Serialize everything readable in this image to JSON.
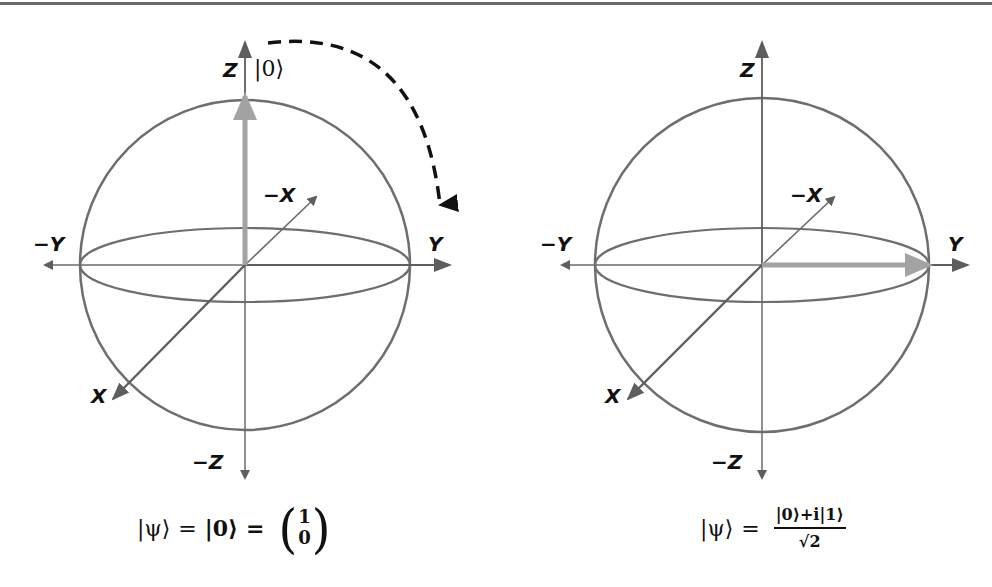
{
  "figure": {
    "colors": {
      "axis": "#6b6b6b",
      "sphere": "#6e6e6e",
      "state_vector": "#a3a3a3",
      "rotation_arrow": "#111111",
      "text": "#111111"
    },
    "left_sphere": {
      "axis_labels": {
        "z": "Z",
        "neg_z": "−Z",
        "y": "Y",
        "neg_y": "−Y",
        "x": "X",
        "neg_x": "−X"
      },
      "state_label": "|0⟩",
      "state_vector_direction": "+Z",
      "rotation_arrow": "dashed arc from +Z toward +Y",
      "equation": {
        "lhs": "|ψ⟩",
        "eq1": "=",
        "ket": "|0⟩",
        "eq2": "=",
        "vector_top": "1",
        "vector_bottom": "0",
        "paren_left": "(",
        "paren_right": ")"
      }
    },
    "right_sphere": {
      "axis_labels": {
        "z": "Z",
        "neg_z": "−Z",
        "y": "Y",
        "neg_y": "−Y",
        "x": "X",
        "neg_x": "−X"
      },
      "state_vector_direction": "+Y",
      "equation": {
        "lhs": "|ψ⟩",
        "eq": "=",
        "numerator": "|0⟩+i|1⟩",
        "denominator": "√2"
      }
    }
  }
}
